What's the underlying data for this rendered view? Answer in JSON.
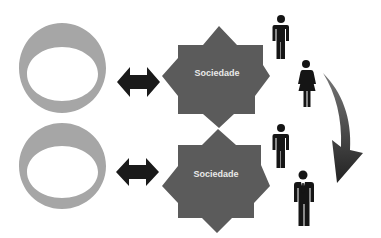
{
  "diagram": {
    "rows": [
      {
        "ring": {
          "color": "#a6a6a6"
        },
        "arrow": {
          "type": "bidirectional",
          "color": "#1a1a1a"
        },
        "star": {
          "label": "Sociedade",
          "points": 8,
          "color": "#5b5b5b"
        },
        "people": [
          {
            "type": "man-icon"
          },
          {
            "type": "woman-icon"
          }
        ]
      },
      {
        "ring": {
          "color": "#a6a6a6"
        },
        "arrow": {
          "type": "bidirectional",
          "color": "#1a1a1a"
        },
        "star": {
          "label": "Sociedade",
          "points": 8,
          "color": "#5b5b5b"
        },
        "people": [
          {
            "type": "man-icon"
          },
          {
            "type": "businessman-icon"
          }
        ]
      }
    ],
    "curved_arrow": {
      "direction": "down",
      "color": "#2a2a2a"
    }
  }
}
